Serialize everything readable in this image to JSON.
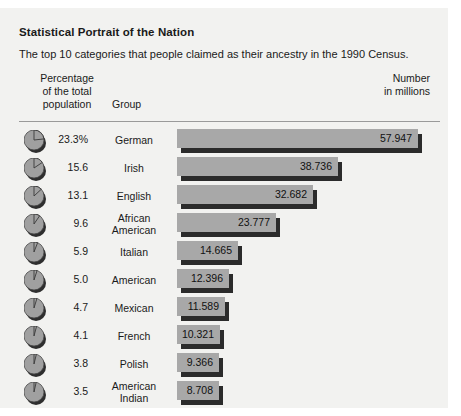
{
  "header": {
    "title": "Statistical Portrait of the Nation",
    "subtitle": "The top 10 categories that people claimed as their ancestry in the 1990 Census."
  },
  "columns": {
    "percentage_line1": "Percentage",
    "percentage_line2": "of the total",
    "percentage_line3": "population",
    "group": "Group",
    "number_line1": "Number",
    "number_line2": "in millions"
  },
  "colors": {
    "background": "#f2f2f0",
    "bar_fill": "#a8a8a8",
    "bar_shadow": "#2b2b2b",
    "pie_fill": "#a0a0a0",
    "rule": "#9a9a9a",
    "text": "#1a1a1a"
  },
  "chart_data": {
    "type": "bar",
    "title": "Statistical Portrait of the Nation",
    "subtitle": "The top 10 categories that people claimed as their ancestry in the 1990 Census.",
    "xlabel": "Number in millions",
    "ylabel": "Group",
    "orientation": "horizontal",
    "grid": false,
    "legend": "none",
    "xlim": [
      0,
      57.947
    ],
    "categories": [
      "German",
      "Irish",
      "English",
      "African American",
      "Italian",
      "American",
      "Mexican",
      "French",
      "Polish",
      "American Indian"
    ],
    "values": [
      57.947,
      38.736,
      32.682,
      23.777,
      14.665,
      12.396,
      11.589,
      10.321,
      9.366,
      8.708
    ],
    "percentages": [
      23.3,
      15.6,
      13.1,
      9.6,
      5.9,
      5.0,
      4.7,
      4.1,
      3.8,
      3.5
    ],
    "rows": [
      {
        "pct_label": "23.3%",
        "pct": 23.3,
        "group": "German",
        "group_line2": "",
        "value_label": "57.947",
        "value": 57.947
      },
      {
        "pct_label": "15.6",
        "pct": 15.6,
        "group": "Irish",
        "group_line2": "",
        "value_label": "38.736",
        "value": 38.736
      },
      {
        "pct_label": "13.1",
        "pct": 13.1,
        "group": "English",
        "group_line2": "",
        "value_label": "32.682",
        "value": 32.682
      },
      {
        "pct_label": "9.6",
        "pct": 9.6,
        "group": "African",
        "group_line2": "American",
        "value_label": "23.777",
        "value": 23.777
      },
      {
        "pct_label": "5.9",
        "pct": 5.9,
        "group": "Italian",
        "group_line2": "",
        "value_label": "14.665",
        "value": 14.665
      },
      {
        "pct_label": "5.0",
        "pct": 5.0,
        "group": "American",
        "group_line2": "",
        "value_label": "12.396",
        "value": 12.396
      },
      {
        "pct_label": "4.7",
        "pct": 4.7,
        "group": "Mexican",
        "group_line2": "",
        "value_label": "11.589",
        "value": 11.589
      },
      {
        "pct_label": "4.1",
        "pct": 4.1,
        "group": "French",
        "group_line2": "",
        "value_label": "10.321",
        "value": 10.321
      },
      {
        "pct_label": "3.8",
        "pct": 3.8,
        "group": "Polish",
        "group_line2": "",
        "value_label": "9.366",
        "value": 9.366
      },
      {
        "pct_label": "3.5",
        "pct": 3.5,
        "group": "American",
        "group_line2": "Indian",
        "value_label": "8.708",
        "value": 8.708
      }
    ]
  }
}
